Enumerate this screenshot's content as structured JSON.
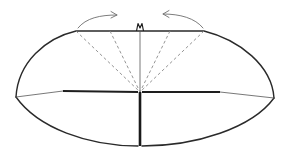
{
  "diagram": {
    "type": "origami-fold-diagram",
    "colors": {
      "background": "#ffffff",
      "outline": "#2a2a2a",
      "valley_fold": "#8a8a8a",
      "arrow": "#6e6e6e"
    },
    "elements": {
      "top_edge": {
        "x1": 76,
        "y1": 31,
        "x2": 204,
        "y2": 31
      },
      "left_corner": {
        "x": 16,
        "y": 97
      },
      "right_corner": {
        "x": 274,
        "y": 98
      },
      "center_point": {
        "x": 140,
        "y": 92
      },
      "bottom_point": {
        "x": 140,
        "y": 146
      },
      "valley_folds": [
        {
          "from": [
            76,
            31
          ],
          "to": [
            140,
            92
          ]
        },
        {
          "from": [
            110,
            31
          ],
          "to": [
            140,
            92
          ]
        },
        {
          "from": [
            170,
            31
          ],
          "to": [
            140,
            92
          ]
        },
        {
          "from": [
            204,
            31
          ],
          "to": [
            140,
            92
          ]
        }
      ],
      "arrows": [
        {
          "name": "left-fold-arrow",
          "direction": "right",
          "from": [
            78,
            28
          ],
          "to": [
            117,
            15
          ]
        },
        {
          "name": "right-fold-arrow",
          "direction": "left",
          "from": [
            203,
            28
          ],
          "to": [
            163,
            14
          ]
        }
      ],
      "top_mark": {
        "x": 140,
        "y": 27,
        "shape": "W"
      }
    }
  }
}
